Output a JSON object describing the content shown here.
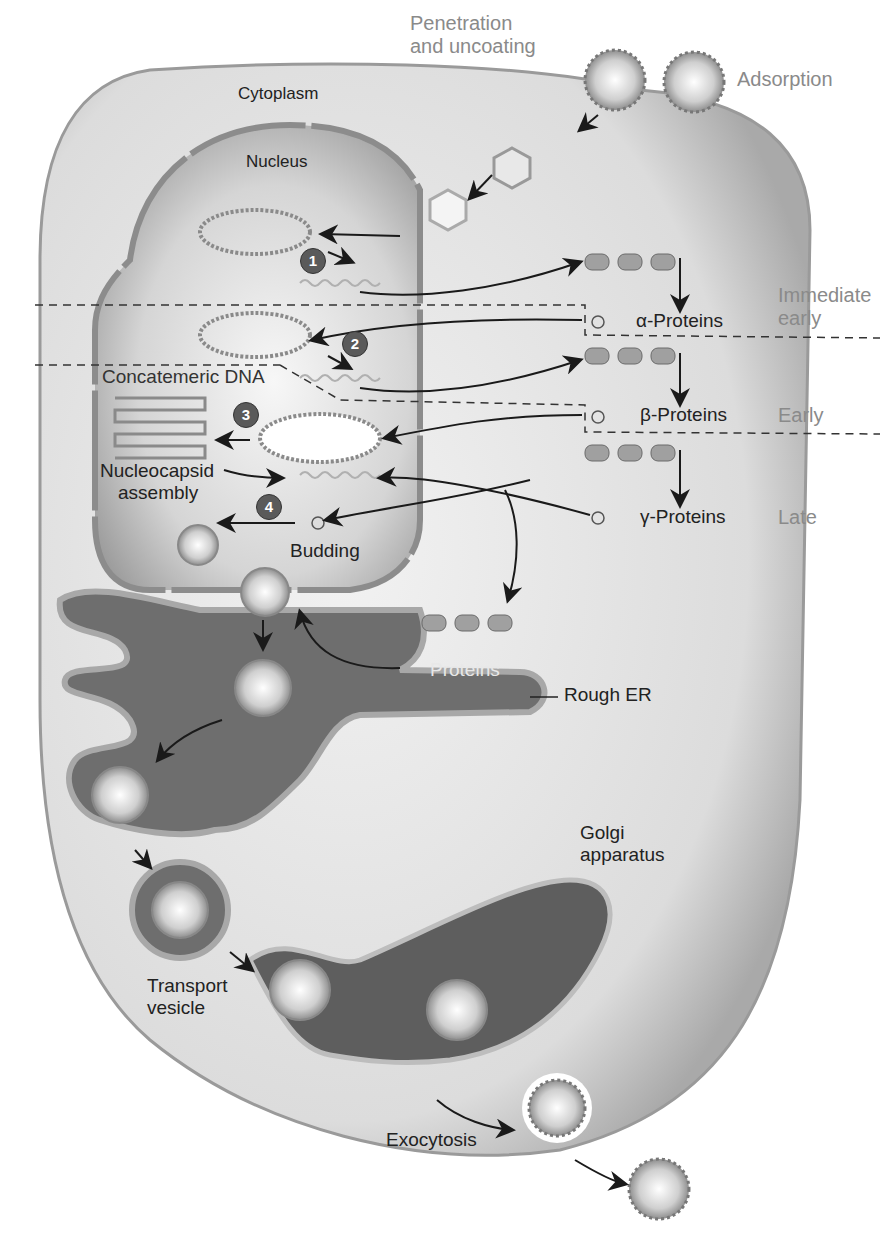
{
  "diagram": {
    "title_caption_fragment": "",
    "labels": {
      "penetration": [
        "Penetration",
        "and uncoating"
      ],
      "adsorption": "Adsorption",
      "cytoplasm": "Cytoplasm",
      "nucleus": "Nucleus",
      "alpha_proteins": "α-Proteins",
      "beta_proteins": "β-Proteins",
      "gamma_proteins": "γ-Proteins",
      "immediate_early": [
        "Immediate",
        "early"
      ],
      "early": "Early",
      "late": "Late",
      "concatemeric_dna": "Concatemeric DNA",
      "nucleocapsid_assembly": [
        "Nucleocapsid",
        "assembly"
      ],
      "budding": "Budding",
      "proteins": "Proteins",
      "rough_er": "Rough ER",
      "golgi": [
        "Golgi",
        "apparatus"
      ],
      "transport_vesicle": [
        "Transport",
        "vesicle"
      ],
      "exocytosis": "Exocytosis"
    },
    "steps": [
      "1",
      "2",
      "3",
      "4"
    ],
    "colors": {
      "cell_fill": "#d9d9d9",
      "cell_edge": "#9a9a9a",
      "nucleus_fill": "#bdbdbd",
      "er_fill": "#6e6e6e",
      "er_edge": "#a8a8a8",
      "step_badge": "#5a5a5a",
      "phase_label": "#8a8a8a",
      "arrow": "#1a1a1a"
    }
  }
}
